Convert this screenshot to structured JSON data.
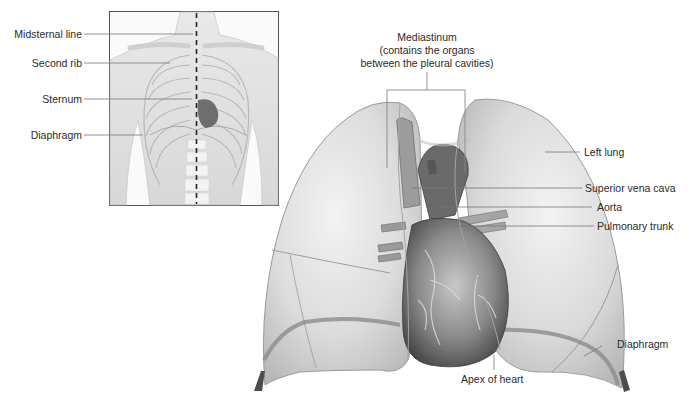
{
  "figure": {
    "inset": {
      "labels": [
        {
          "text": "Midsternal line"
        },
        {
          "text": "Second rib"
        },
        {
          "text": "Sternum"
        },
        {
          "text": "Diaphragm"
        }
      ]
    },
    "main": {
      "mediastinum": {
        "title": "Mediastinum",
        "line2": "(contains the organs",
        "line3": "between the pleural cavities)"
      },
      "labels": [
        {
          "text": "Left lung"
        },
        {
          "text": "Superior vena cava"
        },
        {
          "text": "Aorta"
        },
        {
          "text": "Pulmonary trunk"
        },
        {
          "text": "Diaphragm"
        },
        {
          "text": "Apex of heart"
        }
      ]
    },
    "colors": {
      "lung_fill": "#e4e4e4",
      "lung_edge": "#9a9a9a",
      "heart_dark": "#4a4a4a",
      "diaphragm_band": "#8c8c8c",
      "leader_line": "#777777",
      "inset_border": "#555555"
    }
  }
}
